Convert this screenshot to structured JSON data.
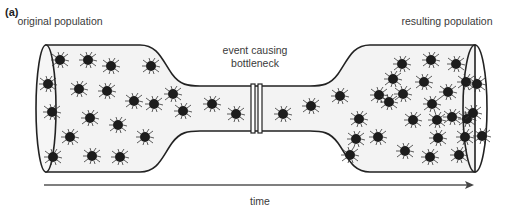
{
  "figure": {
    "panel_label": "(a)",
    "labels": {
      "original_population": "original population",
      "event_line1": "event causing",
      "event_line2": "bottleneck",
      "resulting_population": "resulting population",
      "time_axis": "time"
    },
    "colors": {
      "outline": "#222222",
      "tube_fill": "#f3f3f3",
      "organism": "#1c1c1c",
      "arrow": "#444444"
    },
    "organisms": [
      [
        60,
        60
      ],
      [
        88,
        60
      ],
      [
        111,
        66
      ],
      [
        48,
        84
      ],
      [
        79,
        89
      ],
      [
        107,
        91
      ],
      [
        134,
        101
      ],
      [
        154,
        104
      ],
      [
        52,
        112
      ],
      [
        90,
        118
      ],
      [
        118,
        125
      ],
      [
        145,
        137
      ],
      [
        70,
        137
      ],
      [
        151,
        66
      ],
      [
        173,
        94
      ],
      [
        183,
        111
      ],
      [
        53,
        157
      ],
      [
        92,
        156
      ],
      [
        120,
        157
      ],
      [
        212,
        104
      ],
      [
        236,
        114
      ],
      [
        283,
        114
      ],
      [
        311,
        106
      ],
      [
        340,
        96
      ],
      [
        359,
        119
      ],
      [
        356,
        139
      ],
      [
        379,
        95
      ],
      [
        389,
        102
      ],
      [
        393,
        79
      ],
      [
        403,
        94
      ],
      [
        402,
        64
      ],
      [
        431,
        60
      ],
      [
        456,
        64
      ],
      [
        413,
        120
      ],
      [
        432,
        104
      ],
      [
        448,
        92
      ],
      [
        466,
        82
      ],
      [
        437,
        120
      ],
      [
        452,
        117
      ],
      [
        467,
        119
      ],
      [
        378,
        137
      ],
      [
        405,
        151
      ],
      [
        438,
        138
      ],
      [
        465,
        137
      ],
      [
        482,
        136
      ],
      [
        430,
        157
      ],
      [
        459,
        155
      ],
      [
        477,
        84
      ],
      [
        473,
        113
      ],
      [
        350,
        155
      ],
      [
        424,
        82
      ]
    ]
  }
}
